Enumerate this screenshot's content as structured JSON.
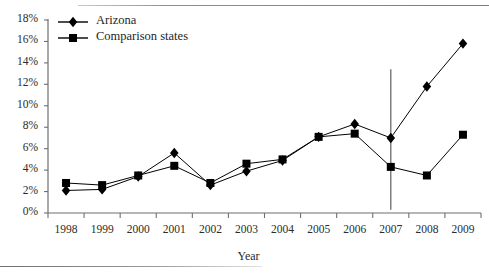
{
  "chart_data": {
    "type": "line",
    "title": "",
    "xlabel": "Year",
    "ylabel": "",
    "grid": false,
    "legend_position": "top-left",
    "categories": [
      "1998",
      "1999",
      "2000",
      "2001",
      "2002",
      "2003",
      "2004",
      "2005",
      "2006",
      "2007",
      "2008",
      "2009"
    ],
    "x": [
      1998,
      1999,
      2000,
      2001,
      2002,
      2003,
      2004,
      2005,
      2006,
      2007,
      2008,
      2009
    ],
    "xlim": [
      1997.5,
      2009.5
    ],
    "ylim": [
      0,
      18
    ],
    "ytick_labels": [
      "0%",
      "2%",
      "4%",
      "6%",
      "8%",
      "10%",
      "12%",
      "14%",
      "16%",
      "18%"
    ],
    "ytick_values": [
      0,
      2,
      4,
      6,
      8,
      10,
      12,
      14,
      16,
      18
    ],
    "xtick_labels": [
      "1998",
      "1999",
      "2000",
      "2001",
      "2002",
      "2003",
      "2004",
      "2005",
      "2006",
      "2007",
      "2008",
      "2009"
    ],
    "value_suffix": "%",
    "series": [
      {
        "name": "Arizona",
        "marker": "diamond",
        "color": "#000000",
        "values": [
          2.1,
          2.2,
          3.4,
          5.6,
          2.6,
          3.9,
          4.9,
          7.1,
          8.3,
          7.0,
          11.8,
          15.8
        ]
      },
      {
        "name": "Comparison states",
        "marker": "square",
        "color": "#000000",
        "values": [
          2.8,
          2.6,
          3.5,
          4.4,
          2.8,
          4.6,
          5.0,
          7.1,
          7.4,
          4.3,
          3.5,
          7.3
        ]
      }
    ],
    "annotations": [
      {
        "name": "intervention-reference-line",
        "type": "vline",
        "x": 2007,
        "y_top": 13.4,
        "y_bottom": 0.3,
        "color": "#6b6b6b"
      }
    ]
  },
  "legend": {
    "items": [
      {
        "label": "Arizona",
        "marker": "diamond-icon"
      },
      {
        "label": "Comparison states",
        "marker": "square-icon"
      }
    ]
  },
  "axes": {
    "x_title": "Year"
  },
  "colors": {
    "axis": "#6f6f6f",
    "series": "#000000",
    "text": "#1e1e1e",
    "frame": "#8d8d8d"
  }
}
